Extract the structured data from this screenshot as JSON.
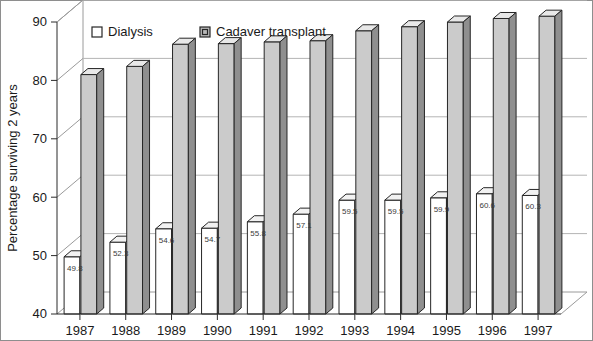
{
  "chart_data": {
    "type": "bar",
    "title": "",
    "subtitle": "",
    "xlabel": "",
    "ylabel": "Percentage surviving 2 years",
    "categories": [
      "1987",
      "1988",
      "1989",
      "1990",
      "1991",
      "1992",
      "1993",
      "1994",
      "1995",
      "1996",
      "1997"
    ],
    "series": [
      {
        "name": "Dialysis",
        "color": "#ffffff",
        "values": [
          49.8,
          52.3,
          54.6,
          54.7,
          55.8,
          57.1,
          59.5,
          59.5,
          59.9,
          60.6,
          60.3
        ],
        "labels": [
          "49.8",
          "52.3",
          "54.6",
          "54.7",
          "55.8",
          "57.1",
          "59.5",
          "59.5",
          "59.9",
          "60.6",
          "60.3"
        ],
        "show_value_labels": true
      },
      {
        "name": "Cadaver transplant",
        "color": "#cbcbcb",
        "values": [
          81.0,
          82.4,
          86.2,
          86.3,
          86.6,
          86.8,
          88.5,
          89.2,
          90.0,
          90.6,
          91.0
        ],
        "labels": [
          "",
          "",
          "",
          "",
          "",
          "",
          "",
          "",
          "",
          "",
          ""
        ],
        "show_value_labels": false
      }
    ],
    "ylim": [
      40,
      90
    ],
    "yticks": [
      40,
      50,
      60,
      70,
      80,
      90
    ],
    "ytick_labels": [
      "40",
      "50",
      "60",
      "70",
      "80",
      "90"
    ],
    "grid": true,
    "grid_axis": "y",
    "legend_position": "top-left-inside",
    "style": "3d-bar"
  },
  "legend": {
    "items": [
      {
        "label": "Dialysis",
        "swatch": "white-square-icon"
      },
      {
        "label": "Cadaver transplant",
        "swatch": "gray-square-icon"
      }
    ]
  },
  "axes": {
    "y_title": "Percentage surviving 2 years"
  }
}
